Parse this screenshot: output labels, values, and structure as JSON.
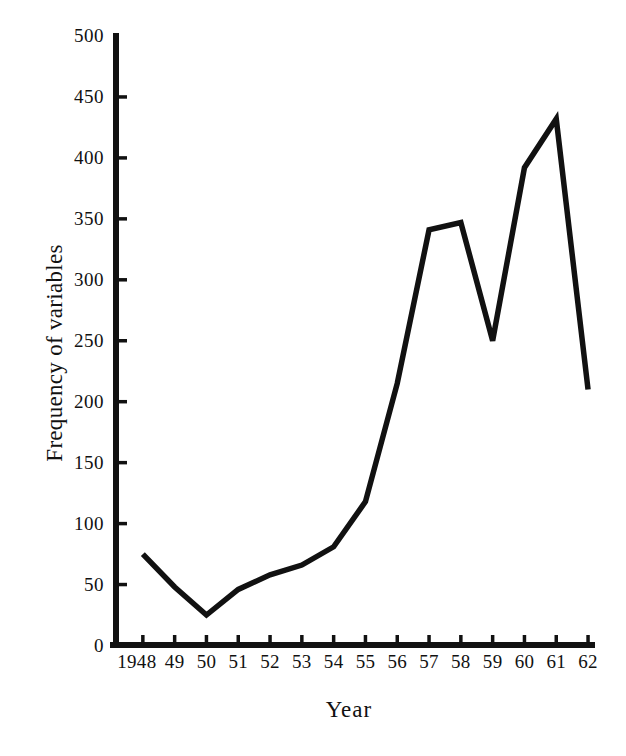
{
  "chart_data": {
    "type": "line",
    "title": "",
    "xlabel": "Year",
    "ylabel": "Frequency of variables",
    "categories": [
      "1948",
      "49",
      "50",
      "51",
      "52",
      "53",
      "54",
      "55",
      "56",
      "57",
      "58",
      "59",
      "60",
      "61",
      "62"
    ],
    "x": [
      1948,
      1949,
      1950,
      1951,
      1952,
      1953,
      1954,
      1955,
      1956,
      1957,
      1958,
      1959,
      1960,
      1961,
      1962
    ],
    "values": [
      75,
      48,
      25,
      46,
      58,
      66,
      81,
      118,
      215,
      341,
      347,
      250,
      392,
      432,
      210
    ],
    "series": [
      {
        "name": "Frequency of variables",
        "values": [
          75,
          48,
          25,
          46,
          58,
          66,
          81,
          118,
          215,
          341,
          347,
          250,
          392,
          432,
          210
        ]
      }
    ],
    "ylim": [
      0,
      500
    ],
    "yticks": [
      0,
      50,
      100,
      150,
      200,
      250,
      300,
      350,
      400,
      450,
      500
    ],
    "ytick_labels": [
      "0",
      "50",
      "100",
      "150",
      "200",
      "250",
      "300",
      "350",
      "400",
      "450",
      "500"
    ],
    "grid": false,
    "legend": false,
    "line_color": "#111111",
    "background_color": "#ffffff"
  }
}
